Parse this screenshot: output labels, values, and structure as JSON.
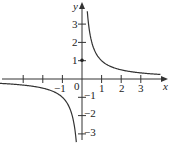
{
  "chart_data": {
    "type": "line",
    "title": "",
    "function": "y = 1/x",
    "xlabel": "x",
    "ylabel": "y",
    "xlim": [
      -4.2,
      4.1
    ],
    "ylim": [
      -3.6,
      4.3
    ],
    "grid": false,
    "legend": null,
    "x_ticks": [
      -3,
      -2,
      -1,
      1,
      2,
      3
    ],
    "x_tick_labels": [
      "-1",
      "0",
      "1",
      "2",
      "3"
    ],
    "y_ticks": [
      -3,
      -2,
      -1,
      1,
      2,
      3
    ],
    "y_tick_labels": [
      "3",
      "2",
      "1",
      "-1",
      "-2",
      "-3"
    ],
    "annotations": [
      {
        "type": "point",
        "x": 0,
        "y": 1
      }
    ],
    "series": [
      {
        "name": "branch-positive",
        "x": [
          0.27,
          0.3,
          0.4,
          0.5,
          0.75,
          1,
          1.5,
          2,
          2.5,
          3,
          3.5,
          4
        ],
        "y": [
          3.7,
          3.33,
          2.5,
          2,
          1.33,
          1,
          0.67,
          0.5,
          0.4,
          0.33,
          0.29,
          0.25
        ]
      },
      {
        "name": "branch-negative",
        "x": [
          -4.2,
          -3.5,
          -3,
          -2.5,
          -2,
          -1.5,
          -1,
          -0.75,
          -0.5,
          -0.4,
          -0.33,
          -0.29
        ],
        "y": [
          -0.24,
          -0.29,
          -0.33,
          -0.4,
          -0.5,
          -0.67,
          -1,
          -1.33,
          -2,
          -2.5,
          -3,
          -3.45
        ]
      }
    ]
  },
  "labels": {
    "x_axis": "x",
    "y_axis": "y",
    "origin": "0",
    "xm1": "−1",
    "x1": "1",
    "x2": "2",
    "x3": "3",
    "y3": "3",
    "y2": "2",
    "y1": "1",
    "ym1": "−1",
    "ym2": "−2",
    "ym3": "−3"
  }
}
